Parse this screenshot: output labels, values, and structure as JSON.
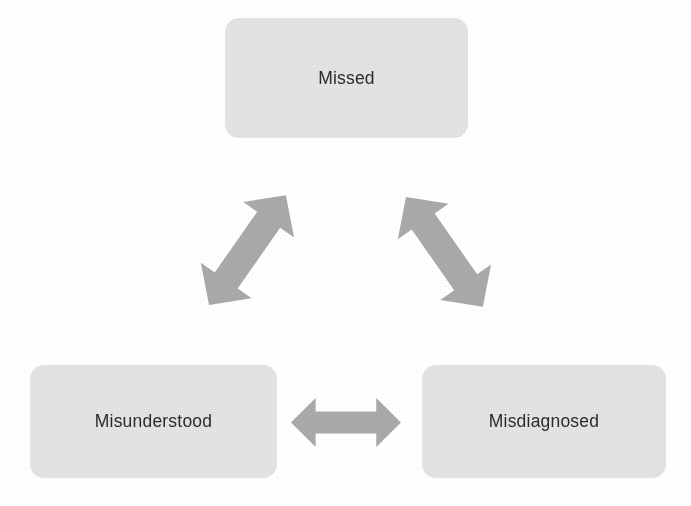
{
  "diagram": {
    "type": "triangular-cycle",
    "background_color": "#ffffff",
    "node_fill_color": "#e3e3e3",
    "node_text_color": "#2b2b2b",
    "arrow_color": "#a9a9a9",
    "nodes": [
      {
        "id": "missed",
        "label": "Missed",
        "position": "top"
      },
      {
        "id": "misunderstood",
        "label": "Misunderstood",
        "position": "bottom-left"
      },
      {
        "id": "misdiagnosed",
        "label": "Misdiagnosed",
        "position": "bottom-right"
      }
    ],
    "connectors": [
      {
        "id": "missed-misunderstood",
        "from": "missed",
        "to": "misunderstood",
        "style": "double-headed",
        "orientation": "diagonal-down-left"
      },
      {
        "id": "missed-misdiagnosed",
        "from": "missed",
        "to": "misdiagnosed",
        "style": "double-headed",
        "orientation": "diagonal-down-right"
      },
      {
        "id": "misunderstood-misdiagnosed",
        "from": "misunderstood",
        "to": "misdiagnosed",
        "style": "double-headed",
        "orientation": "horizontal"
      }
    ]
  }
}
